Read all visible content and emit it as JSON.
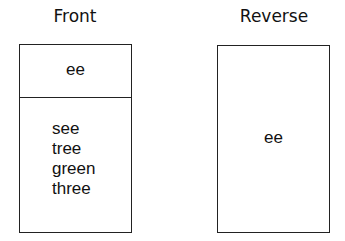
{
  "front": {
    "title": "Front",
    "top_text": "ee",
    "list": [
      "see",
      "tree",
      "green",
      "three"
    ]
  },
  "reverse": {
    "title": "Reverse",
    "text": "ee"
  }
}
